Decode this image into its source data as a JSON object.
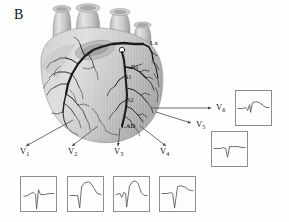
{
  "figure": {
    "panel_label": "B",
    "caption_type": "anatomical-diagram-with-ecg-traces",
    "background_color": "#ffffff",
    "heart": {
      "description": "anterior view of human heart with coronary artery tree",
      "fill_light": "#d9d9d9",
      "fill_mid": "#bfbfbf",
      "fill_dark": "#9e9e9e",
      "artery_color": "#1c1c1c",
      "occlusion_marker": {
        "name": "occlusion-site-marker",
        "shape": "circle",
        "fill": "#ffffff",
        "stroke": "#111111"
      }
    },
    "annotations": [
      {
        "id": "lx",
        "text": "Lx",
        "x": 150,
        "y": 45
      },
      {
        "id": "d1",
        "text": "D1",
        "x": 131,
        "y": 69
      },
      {
        "id": "s1",
        "text": "S1",
        "x": 125,
        "y": 79
      },
      {
        "id": "s2",
        "text": "S2",
        "x": 127,
        "y": 102
      },
      {
        "id": "lad",
        "text": "LAD",
        "x": 122,
        "y": 127
      }
    ],
    "leads": [
      {
        "id": "V1",
        "label": "V",
        "sub": "1",
        "label_x": 20,
        "label_y": 152,
        "box_x": 20,
        "box_y": 176,
        "box_w": 37,
        "box_h": 36,
        "trace": "M3,20 L7,19 L10,17 L13,16 L15,18 L16,33 L18,13 L20,18 L24,18 L30,17 L34,17",
        "morphology": "rS complex, deep narrow S wave, minimal ST elevation"
      },
      {
        "id": "V2",
        "label": "V",
        "sub": "2",
        "label_x": 68,
        "label_y": 152,
        "box_x": 67,
        "box_y": 176,
        "box_w": 37,
        "box_h": 36,
        "trace": "M2,19 L8,19 L10,19 L12,32 L14,10 L17,6 L21,5 L24,7 L27,12 L30,17 L34,18",
        "morphology": "deep S wave with marked convex ST segment elevation"
      },
      {
        "id": "V3",
        "label": "V",
        "sub": "3",
        "label_x": 114,
        "label_y": 152,
        "box_x": 113,
        "box_y": 176,
        "box_w": 37,
        "box_h": 36,
        "trace": "M2,18 L6,17 L8,21 L10,16 L12,17 L13,31 L16,9 L19,5 L22,4 L25,7 L28,16 L31,19 L34,19",
        "morphology": "deep S wave with marked ST elevation, initial notch"
      },
      {
        "id": "V4",
        "label": "V",
        "sub": "4",
        "label_x": 160,
        "label_y": 152,
        "box_x": 159,
        "box_y": 176,
        "box_w": 37,
        "box_h": 36,
        "trace": "M2,17 L8,17 L11,16 L13,17 L15,32 L18,10 L21,9 L25,10 L29,13 L32,14 L34,14",
        "morphology": "deep narrow S wave with moderate ST elevation"
      },
      {
        "id": "V5",
        "label": "V",
        "sub": "5",
        "label_x": 196,
        "label_y": 125,
        "box_x": 211,
        "box_y": 131,
        "box_w": 37,
        "box_h": 36,
        "trace": "M2,17 L9,17 L12,16 L14,17 L16,26 L18,15 L21,15 L26,15 L31,16 L34,16",
        "morphology": "narrow QS/rS deflection, near isoelectric ST"
      },
      {
        "id": "V6",
        "label": "V",
        "sub": "6",
        "label_x": 216,
        "label_y": 104,
        "box_x": 235,
        "box_y": 90,
        "box_w": 37,
        "box_h": 36,
        "trace": "M2,18 L7,18 L10,17 L12,20 L14,14 L15,22 L17,12 L20,11 L24,12 L28,15 L31,17 L34,17",
        "morphology": "small qR complex, minimal ST change"
      }
    ],
    "pointers": [
      {
        "id": "pointer-V1",
        "from_x": 73,
        "from_y": 120,
        "to_x": 26,
        "to_y": 146
      },
      {
        "id": "pointer-V2",
        "from_x": 98,
        "from_y": 126,
        "to_x": 72,
        "to_y": 146
      },
      {
        "id": "pointer-V3",
        "from_x": 120,
        "from_y": 128,
        "to_x": 118,
        "to_y": 146
      },
      {
        "id": "pointer-V4",
        "from_x": 140,
        "from_y": 126,
        "to_x": 166,
        "to_y": 146
      },
      {
        "id": "pointer-V5",
        "from_x": 156,
        "from_y": 110,
        "to_x": 191,
        "to_y": 123
      },
      {
        "id": "pointer-V6",
        "from_x": 152,
        "from_y": 108,
        "to_x": 211,
        "to_y": 108
      }
    ],
    "pointer_color": "#4a4a4a",
    "box_border_color": "#8e8e8e",
    "trace_color": "#5a5a5a"
  }
}
